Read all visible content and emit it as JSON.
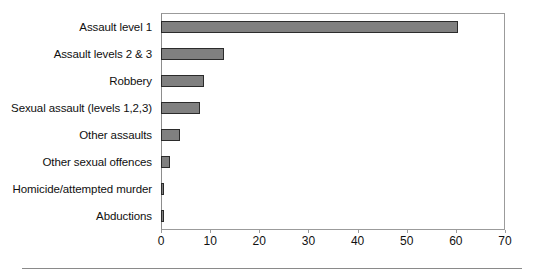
{
  "chart_data": {
    "type": "bar",
    "orientation": "horizontal",
    "title": "",
    "subtitle": "",
    "xlabel": "",
    "ylabel": "",
    "categories": [
      "Assault level 1",
      "Assault levels 2 & 3",
      "Robbery",
      "Sexual assault (levels 1,2,3)",
      "Other assaults",
      "Other sexual offences",
      "Homicide/attempted murder",
      "Abductions"
    ],
    "values": [
      60.5,
      12.8,
      8.8,
      7.9,
      3.9,
      1.8,
      0.5,
      0.5
    ],
    "xlim": [
      0,
      70
    ],
    "xticks": [
      0,
      10,
      20,
      30,
      40,
      50,
      60,
      70
    ],
    "xtick_labels": [
      "0",
      "10",
      "20",
      "30",
      "40",
      "50",
      "60",
      "70"
    ],
    "grid": false,
    "legend": false,
    "legend_position": "none",
    "bar_color": "#808080",
    "bar_border_color": "#2b2b2b",
    "frame_color": "#9b9b9b",
    "background": "#ffffff"
  }
}
